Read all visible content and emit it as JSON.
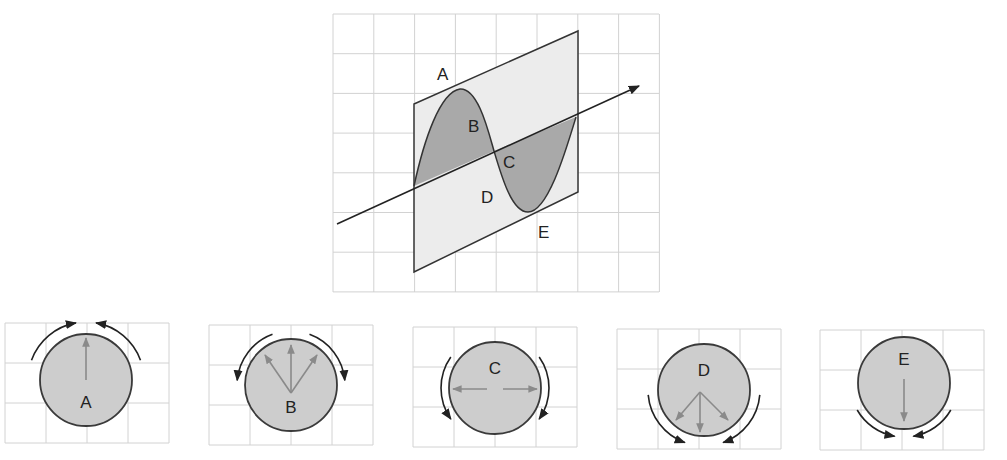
{
  "main_diagram": {
    "description": "Sinusoidal wave on a plane with propagation axis",
    "labels": [
      "A",
      "B",
      "C",
      "D",
      "E"
    ],
    "colors": {
      "plane_fill": "#ececec",
      "wave_fill": "#a9a9a9",
      "line": "#333333",
      "grid": "#d2d2d2"
    }
  },
  "panels": [
    {
      "label": "A",
      "inner_arrows": "up",
      "outer_rotation": "converging-top"
    },
    {
      "label": "B",
      "inner_arrows": "up-fan",
      "outer_rotation": "diverging-top"
    },
    {
      "label": "C",
      "inner_arrows": "left-right",
      "outer_rotation": "downward-sides"
    },
    {
      "label": "D",
      "inner_arrows": "down-fan",
      "outer_rotation": "converging-bottom"
    },
    {
      "label": "E",
      "inner_arrows": "down",
      "outer_rotation": "converging-bottom"
    }
  ],
  "colors": {
    "circle_fill": "#cdcdcd",
    "circle_stroke": "#3a3a3a",
    "inner_arrow": "#8a8a8a",
    "outer_arrow": "#222222"
  }
}
